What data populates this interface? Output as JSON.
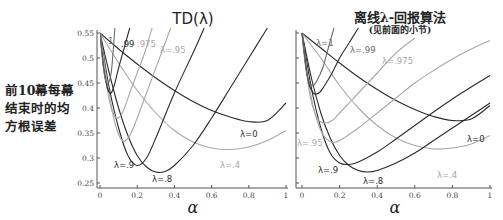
{
  "y_axis_label_lines": [
    "前10幕每幕",
    "结束时的均",
    "方根误差"
  ],
  "colors": {
    "dark": "#2b2b2b",
    "mid": "#6a6a6a",
    "light": "#a8a8a8"
  },
  "chart_data": [
    {
      "type": "line",
      "title": "TD(λ)",
      "subtitle": "",
      "xlabel": "α",
      "ylabel": "前10幕每幕结束时的均方根误差",
      "xlim": [
        0,
        1
      ],
      "ylim": [
        0.25,
        0.55
      ],
      "xticks": [
        "0",
        "0.2",
        "0.4",
        "0.6",
        "0.8",
        "1"
      ],
      "yticks": [
        "0.25",
        "0.3",
        "0.35",
        "0.4",
        "0.45",
        "0.5",
        "0.55"
      ],
      "grid": false,
      "series": [
        {
          "name": "λ=0",
          "label": "λ=0",
          "shade": "dark",
          "x": [
            0,
            0.1,
            0.2,
            0.3,
            0.4,
            0.5,
            0.6,
            0.7,
            0.8,
            0.9,
            1.0
          ],
          "y": [
            0.55,
            0.518,
            0.488,
            0.46,
            0.435,
            0.413,
            0.395,
            0.382,
            0.373,
            0.375,
            0.41
          ]
        },
        {
          "name": "λ=.4",
          "label": "λ=.4",
          "shade": "light",
          "x": [
            0,
            0.1,
            0.2,
            0.3,
            0.4,
            0.5,
            0.6,
            0.7,
            0.8,
            0.9,
            1.0
          ],
          "y": [
            0.55,
            0.49,
            0.435,
            0.39,
            0.355,
            0.332,
            0.32,
            0.317,
            0.322,
            0.335,
            0.355
          ]
        },
        {
          "name": "λ=.8",
          "label": "λ=.8",
          "shade": "dark",
          "x": [
            0,
            0.05,
            0.1,
            0.15,
            0.2,
            0.25,
            0.3,
            0.35,
            0.4,
            0.5,
            0.6,
            0.7,
            0.8,
            0.9
          ],
          "y": [
            0.55,
            0.47,
            0.4,
            0.345,
            0.305,
            0.282,
            0.272,
            0.273,
            0.285,
            0.325,
            0.38,
            0.44,
            0.5,
            0.56
          ]
        },
        {
          "name": "λ=.9",
          "label": "λ=.9",
          "shade": "dark",
          "x": [
            0,
            0.05,
            0.1,
            0.15,
            0.2,
            0.25,
            0.3,
            0.4,
            0.5,
            0.56
          ],
          "y": [
            0.55,
            0.44,
            0.36,
            0.305,
            0.285,
            0.3,
            0.34,
            0.43,
            0.51,
            0.56
          ]
        },
        {
          "name": "λ=.95",
          "label": "λ=.95",
          "shade": "light",
          "x": [
            0,
            0.04,
            0.08,
            0.12,
            0.16,
            0.2,
            0.25,
            0.3,
            0.38
          ],
          "y": [
            0.55,
            0.45,
            0.37,
            0.335,
            0.345,
            0.38,
            0.43,
            0.48,
            0.56
          ]
        },
        {
          "name": "λ=.975",
          "label": ".975",
          "shade": "light",
          "x": [
            0,
            0.03,
            0.06,
            0.09,
            0.12,
            0.16,
            0.2,
            0.24,
            0.28
          ],
          "y": [
            0.55,
            0.46,
            0.4,
            0.38,
            0.39,
            0.43,
            0.47,
            0.51,
            0.56
          ]
        },
        {
          "name": "λ=.99",
          "label": ".99",
          "shade": "dark",
          "x": [
            0,
            0.02,
            0.04,
            0.06,
            0.08,
            0.1,
            0.13,
            0.16
          ],
          "y": [
            0.55,
            0.48,
            0.44,
            0.43,
            0.45,
            0.48,
            0.52,
            0.56
          ]
        },
        {
          "name": "λ=1",
          "label": "1",
          "shade": "mid",
          "x": [
            0,
            0.015,
            0.03,
            0.045,
            0.06,
            0.07,
            0.08
          ],
          "y": [
            0.55,
            0.49,
            0.455,
            0.45,
            0.47,
            0.51,
            0.56
          ]
        }
      ]
    },
    {
      "type": "line",
      "title": "离线λ-回报算法",
      "subtitle": "(见前面的小节)",
      "xlabel": "α",
      "ylabel": "",
      "xlim": [
        0,
        1
      ],
      "ylim": [
        0.25,
        0.55
      ],
      "xticks": [
        "0",
        "0.2",
        "0.4",
        "0.6",
        "0.8",
        "1"
      ],
      "yticks": [
        "0.25",
        "0.3",
        "0.35",
        "0.4",
        "0.45",
        "0.5",
        "0.55"
      ],
      "grid": false,
      "series": [
        {
          "name": "λ=0",
          "label": "λ=0",
          "shade": "dark",
          "x": [
            0,
            0.1,
            0.2,
            0.3,
            0.4,
            0.5,
            0.6,
            0.7,
            0.8,
            0.9,
            1.0
          ],
          "y": [
            0.55,
            0.52,
            0.49,
            0.462,
            0.437,
            0.415,
            0.397,
            0.383,
            0.375,
            0.378,
            0.405
          ]
        },
        {
          "name": "λ=.4",
          "label": "λ=.4",
          "shade": "light",
          "x": [
            0,
            0.1,
            0.2,
            0.3,
            0.4,
            0.5,
            0.6,
            0.7,
            0.8,
            0.9,
            1.0
          ],
          "y": [
            0.55,
            0.5,
            0.445,
            0.4,
            0.365,
            0.34,
            0.325,
            0.318,
            0.32,
            0.328,
            0.345
          ]
        },
        {
          "name": "λ=.8",
          "label": "λ=.8",
          "shade": "dark",
          "x": [
            0,
            0.05,
            0.1,
            0.15,
            0.2,
            0.25,
            0.3,
            0.35,
            0.4,
            0.5,
            0.6,
            0.7,
            0.8,
            0.9,
            1.0
          ],
          "y": [
            0.55,
            0.46,
            0.39,
            0.34,
            0.305,
            0.285,
            0.275,
            0.272,
            0.275,
            0.29,
            0.31,
            0.335,
            0.36,
            0.385,
            0.41
          ]
        },
        {
          "name": "λ=.9",
          "label": "λ=.9",
          "shade": "dark",
          "x": [
            0,
            0.05,
            0.1,
            0.15,
            0.2,
            0.25,
            0.3,
            0.4,
            0.5,
            0.6,
            0.7,
            0.8,
            0.9,
            1.0
          ],
          "y": [
            0.55,
            0.44,
            0.36,
            0.31,
            0.29,
            0.287,
            0.292,
            0.312,
            0.338,
            0.365,
            0.392,
            0.418,
            0.442,
            0.465
          ]
        },
        {
          "name": "λ=.95",
          "label": "λ=.95",
          "shade": "light",
          "x": [
            0,
            0.05,
            0.1,
            0.15,
            0.2,
            0.3,
            0.4,
            0.5,
            0.6,
            0.7,
            0.8,
            0.9,
            1.0
          ],
          "y": [
            0.55,
            0.42,
            0.355,
            0.333,
            0.335,
            0.36,
            0.39,
            0.42,
            0.45,
            0.475,
            0.498,
            0.518,
            0.535
          ]
        },
        {
          "name": "λ=.975",
          "label": "λ=.975",
          "shade": "light",
          "x": [
            0,
            0.04,
            0.08,
            0.12,
            0.16,
            0.2,
            0.3,
            0.4,
            0.5,
            0.6
          ],
          "y": [
            0.55,
            0.43,
            0.38,
            0.37,
            0.375,
            0.39,
            0.43,
            0.47,
            0.51,
            0.54
          ]
        },
        {
          "name": "λ=.99",
          "label": "λ=.99",
          "shade": "dark",
          "x": [
            0,
            0.03,
            0.06,
            0.09,
            0.12,
            0.16,
            0.2,
            0.25,
            0.3
          ],
          "y": [
            0.55,
            0.46,
            0.43,
            0.43,
            0.445,
            0.47,
            0.5,
            0.53,
            0.56
          ]
        },
        {
          "name": "λ=1",
          "label": "λ=1",
          "shade": "mid",
          "x": [
            0,
            0.02,
            0.04,
            0.06,
            0.08,
            0.11,
            0.14,
            0.17
          ],
          "y": [
            0.55,
            0.48,
            0.45,
            0.445,
            0.455,
            0.48,
            0.52,
            0.56
          ]
        }
      ]
    }
  ]
}
